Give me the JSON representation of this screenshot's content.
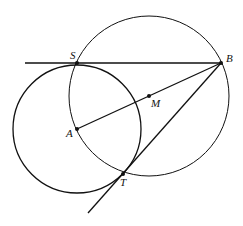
{
  "diagram": {
    "labels": {
      "S": "S",
      "B": "B",
      "M": "M",
      "A": "A",
      "T": "T"
    },
    "points": {
      "S": [
        77,
        63
      ],
      "B": [
        221,
        63
      ],
      "M": [
        149,
        96
      ],
      "A": [
        77,
        129
      ],
      "T": [
        123,
        174
      ]
    },
    "circles": [
      {
        "name": "circle-A",
        "cx": 77,
        "cy": 129,
        "r": 64
      },
      {
        "name": "circle-M",
        "cx": 149,
        "cy": 96,
        "r": 80
      }
    ],
    "stroke_color": "#111111"
  }
}
